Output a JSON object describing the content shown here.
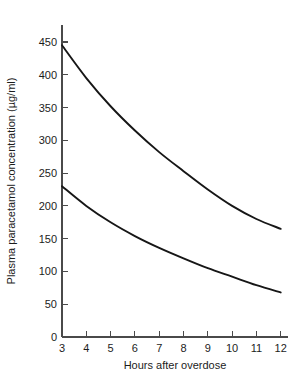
{
  "chart_data": {
    "type": "line",
    "title": "",
    "xlabel": "Hours after overdose",
    "ylabel": "Plasma paracetamol concentration (µg/ml)",
    "xlim": [
      3,
      12.3
    ],
    "ylim": [
      0,
      470
    ],
    "grid": false,
    "legend": "none",
    "x_ticks": [
      3,
      4,
      5,
      6,
      7,
      8,
      9,
      10,
      11,
      12
    ],
    "x_tick_labels": [
      "3",
      "4",
      "5",
      "6",
      "7",
      "8",
      "9",
      "10",
      "11",
      "12"
    ],
    "y_ticks": [
      0,
      50,
      100,
      150,
      200,
      250,
      300,
      350,
      400,
      450
    ],
    "y_tick_labels": [
      "0",
      "50",
      "100",
      "150",
      "200",
      "250",
      "300",
      "350",
      "400",
      "450"
    ],
    "x": [
      3,
      4,
      5,
      6,
      7,
      8,
      9,
      10,
      11,
      12
    ],
    "series": [
      {
        "name": "upper treatment line",
        "color": "#161616",
        "values": [
          445,
          395,
          352,
          315,
          282,
          253,
          225,
          200,
          180,
          165
        ]
      },
      {
        "name": "lower treatment line",
        "color": "#161616",
        "values": [
          230,
          200,
          175,
          154,
          136,
          120,
          105,
          92,
          79,
          68
        ]
      }
    ]
  },
  "axes": {
    "y_axis_label": "Plasma paracetamol concentration (µg/ml)",
    "x_axis_label": "Hours after overdose"
  }
}
